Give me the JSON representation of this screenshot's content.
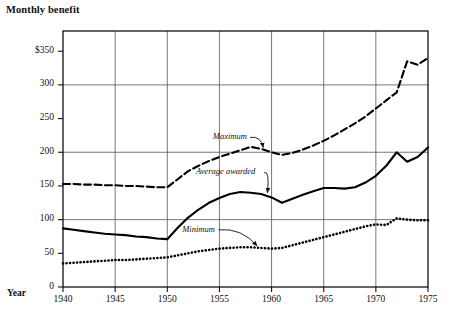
{
  "chart_data": {
    "type": "line",
    "title": "Monthly benefit",
    "xlabel": "Year",
    "ylabel": "",
    "xlim": [
      1940,
      1975
    ],
    "ylim": [
      0,
      380
    ],
    "grid": true,
    "legend_position": "inline-annotations",
    "x_ticks": [
      "1940",
      "1945",
      "1950",
      "1955",
      "1960",
      "1965",
      "1970",
      "1975"
    ],
    "x_tick_values": [
      1940,
      1945,
      1950,
      1955,
      1960,
      1965,
      1970,
      1975
    ],
    "y_ticks": [
      "0",
      "50",
      "100",
      "150",
      "200",
      "250",
      "300",
      "$350"
    ],
    "y_tick_values": [
      0,
      50,
      100,
      150,
      200,
      250,
      300,
      350
    ],
    "gridline_y_values": [
      100,
      200,
      300
    ],
    "x": [
      1940,
      1941,
      1942,
      1943,
      1944,
      1945,
      1946,
      1947,
      1948,
      1949,
      1950,
      1951,
      1952,
      1953,
      1954,
      1955,
      1956,
      1957,
      1958,
      1959,
      1960,
      1961,
      1962,
      1963,
      1964,
      1965,
      1966,
      1967,
      1968,
      1969,
      1970,
      1971,
      1972,
      1973,
      1974,
      1975
    ],
    "series": [
      {
        "name": "Maximum",
        "style": "dashed",
        "values": [
          153,
          153,
          152,
          152,
          151,
          151,
          150,
          150,
          149,
          148,
          148,
          160,
          172,
          180,
          187,
          193,
          198,
          203,
          208,
          205,
          200,
          196,
          199,
          204,
          210,
          217,
          225,
          234,
          243,
          253,
          265,
          277,
          289,
          335,
          330,
          340
        ]
      },
      {
        "name": "Average awarded",
        "style": "solid",
        "values": [
          87,
          85,
          83,
          81,
          79,
          78,
          77,
          75,
          74,
          72,
          71,
          88,
          103,
          115,
          125,
          132,
          138,
          141,
          140,
          138,
          133,
          125,
          131,
          137,
          142,
          147,
          147,
          146,
          148,
          155,
          165,
          180,
          200,
          186,
          193,
          207
        ]
      },
      {
        "name": "Minimum",
        "style": "dotted",
        "values": [
          35,
          36,
          37,
          38,
          39,
          40,
          40,
          41,
          42,
          43,
          44,
          47,
          50,
          53,
          55,
          57,
          58,
          59,
          59,
          58,
          57,
          58,
          62,
          66,
          70,
          74,
          78,
          82,
          86,
          90,
          93,
          92,
          102,
          100,
          99,
          99
        ]
      }
    ],
    "annotations": [
      {
        "text": "Maximum",
        "label_x": 1956.0,
        "label_y": 222,
        "arrow_to_x": 1959.2,
        "arrow_to_y": 207
      },
      {
        "text": "Average awarded",
        "label_x": 1955.6,
        "label_y": 170,
        "arrow_to_x": 1959.6,
        "arrow_to_y": 140
      },
      {
        "text": "Minimum",
        "label_x": 1953.0,
        "label_y": 85,
        "arrow_to_x": 1958.6,
        "arrow_to_y": 61
      }
    ]
  }
}
